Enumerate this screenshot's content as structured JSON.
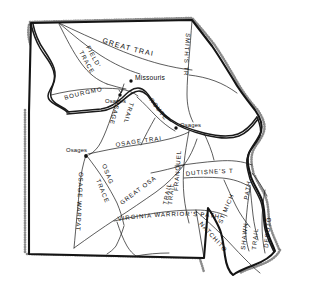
{
  "figure": {
    "region": "Missouri",
    "style": "line-drawing historical map",
    "background_color": "#ffffff",
    "ink_color": "#141414"
  },
  "trails": [
    {
      "id": "great-trail",
      "label": "GREAT TRAIL",
      "orientation": "diagonal",
      "region": "north"
    },
    {
      "id": "fields-trace-1",
      "label": "FIELD'S",
      "orientation": "diagonal",
      "region": "northwest"
    },
    {
      "id": "fields-trace-2",
      "label": "TRACE",
      "orientation": "diagonal",
      "region": "northwest"
    },
    {
      "id": "smiths-trail",
      "label": "SMITH'S TRAIL",
      "orientation": "vertical",
      "region": "northeast"
    },
    {
      "id": "bourgmonts",
      "label": "BOURGMONT'S",
      "orientation": "horizontal",
      "region": "west-central"
    },
    {
      "id": "bourgmonts-route",
      "label": "ROUTE",
      "orientation": "diagonal",
      "region": "central"
    },
    {
      "id": "osage-trail-diagonal-1",
      "label": "OSAGE",
      "orientation": "diagonal",
      "region": "west-central"
    },
    {
      "id": "osage-trail-diagonal-2",
      "label": "TRAIL",
      "orientation": "diagonal",
      "region": "west-central"
    },
    {
      "id": "osage-trail-horizontal",
      "label": "OSAGE TRAIL",
      "orientation": "horizontal",
      "region": "central"
    },
    {
      "id": "osage-warpath",
      "label": "OSAGE WARPATH",
      "orientation": "vertical",
      "region": "west"
    },
    {
      "id": "osage-trace-1",
      "label": "OSAGE",
      "orientation": "diagonal",
      "region": "southwest"
    },
    {
      "id": "osage-trace-2",
      "label": "TRACE",
      "orientation": "diagonal",
      "region": "southwest"
    },
    {
      "id": "great-osage-trail",
      "label": "GREAT OSAGE",
      "orientation": "diagonal",
      "region": "south-central"
    },
    {
      "id": "great-osage-trail-2",
      "label": "TRAIL",
      "orientation": "vertical",
      "region": "south-central"
    },
    {
      "id": "franquelins-trail",
      "label": "FRANQUELIN'S",
      "orientation": "vertical",
      "region": "central"
    },
    {
      "id": "franquelins-trail-2",
      "label": "TRAIL",
      "orientation": "vertical",
      "region": "central"
    },
    {
      "id": "dutisnes-trail",
      "label": "DUTISNE'S TRAIL",
      "orientation": "horizontal",
      "region": "east-central"
    },
    {
      "id": "virginia-warriors-path",
      "label": "VIRGINIA WARRIOR'S PATH",
      "orientation": "horizontal",
      "region": "south"
    },
    {
      "id": "st-michaels-path-1",
      "label": "ST MICHAELS",
      "orientation": "diagonal",
      "region": "southeast"
    },
    {
      "id": "st-michaels-path-2",
      "label": "PATH",
      "orientation": "vertical",
      "region": "southeast"
    },
    {
      "id": "natchitoches-trail",
      "label": "NATCHITOCHES",
      "orientation": "diagonal",
      "region": "south-southeast"
    },
    {
      "id": "shawnee-trail",
      "label": "SHAWNEE",
      "orientation": "vertical",
      "region": "southeast"
    },
    {
      "id": "shawnee-trail-2",
      "label": "TRAIL",
      "orientation": "vertical",
      "region": "southeast"
    },
    {
      "id": "desoto-trail",
      "label": "DESOTO",
      "orientation": "vertical",
      "region": "southeast"
    }
  ],
  "settlements": [
    {
      "id": "missouris",
      "label": "Missouris",
      "marker": "dot"
    },
    {
      "id": "osages-north",
      "label": "Osages",
      "marker": "dot"
    },
    {
      "id": "osages-west",
      "label": "Osages",
      "marker": "dot"
    },
    {
      "id": "osages-central",
      "label": "Osages",
      "marker": "dot"
    }
  ]
}
